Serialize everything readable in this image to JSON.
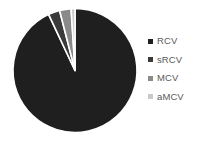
{
  "chart_data": {
    "type": "pie",
    "title": "",
    "categories": [
      "RCV",
      "sRCV",
      "MCV",
      "aMCV"
    ],
    "values": [
      93,
      3,
      3,
      1
    ],
    "units": "percent",
    "colors": [
      "#1f1f1f",
      "#3a3a3a",
      "#8a8a8a",
      "#c9c9c9"
    ],
    "start_angle_deg": 0,
    "direction": "clockwise",
    "slice_border_color": "#ffffff",
    "slice_border_width": 1.6,
    "legend_position": "right",
    "labels_shown": false,
    "grid": false
  },
  "legend": {
    "marker_icon": "square-marker-icon",
    "items": [
      {
        "label": "RCV",
        "color": "#1f1f1f"
      },
      {
        "label": "sRCV",
        "color": "#3a3a3a"
      },
      {
        "label": "MCV",
        "color": "#8a8a8a"
      },
      {
        "label": "aMCV",
        "color": "#c9c9c9"
      }
    ]
  },
  "style": {
    "background": "#ffffff",
    "text_color": "#595959"
  }
}
